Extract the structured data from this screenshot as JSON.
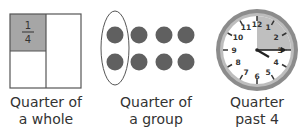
{
  "panels": [
    {
      "id": "whole",
      "fraction": {
        "numerator": "1",
        "denominator": "4"
      },
      "label_line1": "Quarter of",
      "label_line2": "a whole"
    },
    {
      "id": "group",
      "rows": 2,
      "cols": 4,
      "circled_cols": 1,
      "label_line1": "Quarter of",
      "label_line2": "a group"
    },
    {
      "id": "clock",
      "numbers": [
        "12",
        "1",
        "2",
        "3",
        "4",
        "5",
        "6",
        "7",
        "8",
        "9",
        "10",
        "11"
      ],
      "time": "4:15",
      "label_line1": "Quarter",
      "label_line2": "past 4"
    }
  ],
  "colors": {
    "shade": "#a6a6a6",
    "dot": "#606060",
    "outline": "#555555",
    "clock_rim": "#8c8c8c",
    "clock_face": "#ffffff"
  }
}
